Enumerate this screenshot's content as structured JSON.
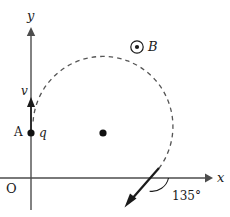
{
  "figure": {
    "axes": {
      "y_label": "y",
      "x_label": "x",
      "origin_label": "O"
    },
    "points": {
      "start_point_label": "A",
      "charge_label": "q",
      "velocity_label": "v",
      "field_label": "B",
      "field_symbol": "dot-in-circle-out-of-page"
    },
    "annotations": {
      "exit_angle": "135°"
    },
    "colors": {
      "ink": "#1a1a1a",
      "axis": "#4d4d4d",
      "dashed_path": "#555555"
    },
    "geometry": {
      "y_axis_x": 31,
      "x_axis_y": 178,
      "circle_center_x": 103,
      "circle_center_y": 133,
      "circle_radius": 70,
      "point_a_x": 31,
      "point_a_y": 133
    }
  }
}
